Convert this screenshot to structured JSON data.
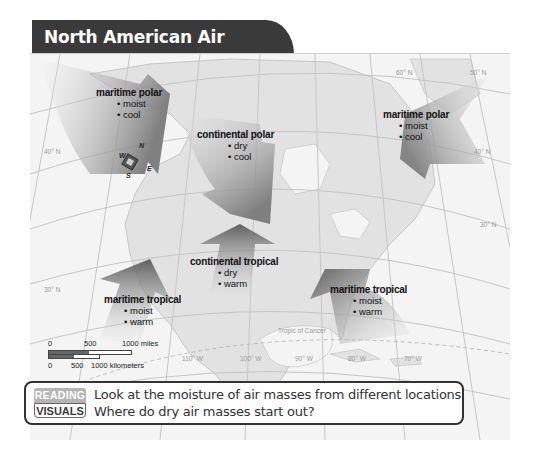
{
  "title": "North American Air Masses",
  "air_masses": [
    {
      "id": "mp-west",
      "name": "maritime polar",
      "traits": [
        "moist",
        "cool"
      ]
    },
    {
      "id": "cp",
      "name": "continental polar",
      "traits": [
        "dry",
        "cool"
      ]
    },
    {
      "id": "mp-east",
      "name": "maritime polar",
      "traits": [
        "moist",
        "cool"
      ]
    },
    {
      "id": "ct",
      "name": "continental tropical",
      "traits": [
        "dry",
        "warm"
      ]
    },
    {
      "id": "mt-west",
      "name": "maritime tropical",
      "traits": [
        "moist",
        "warm"
      ]
    },
    {
      "id": "mt-east",
      "name": "maritime tropical",
      "traits": [
        "moist",
        "warm"
      ]
    }
  ],
  "grid_labels": {
    "lat_60": "60° N",
    "lat_50": "50° N",
    "lat_40_w": "40° N",
    "lat_40_e": "40° N",
    "lat_30_w": "30° N",
    "lat_30_e": "30° N",
    "lon_110": "110° W",
    "lon_100": "100° W",
    "lon_90": "90° W",
    "lon_80": "80° W",
    "lon_70": "70° W",
    "tropic": "Tropic of Cancer"
  },
  "compass": {
    "n": "N",
    "e": "E",
    "s": "S",
    "w": "W"
  },
  "scale": {
    "miles": [
      "0",
      "500",
      "1000 miles"
    ],
    "km": [
      "0",
      "500",
      "1000 kilometers"
    ]
  },
  "callout": {
    "badge_top": "READING",
    "badge_bottom": "VISUALS",
    "question": "Look at the moisture of air masses from different locations. Where do dry air masses start out?"
  },
  "colors": {
    "title_bg": "#3a3a3a",
    "arrow_dark": "#6e6e6e",
    "arrow_light": "#d8d8d8",
    "land": "#e2e2e2",
    "water": "#f4f4f4"
  }
}
